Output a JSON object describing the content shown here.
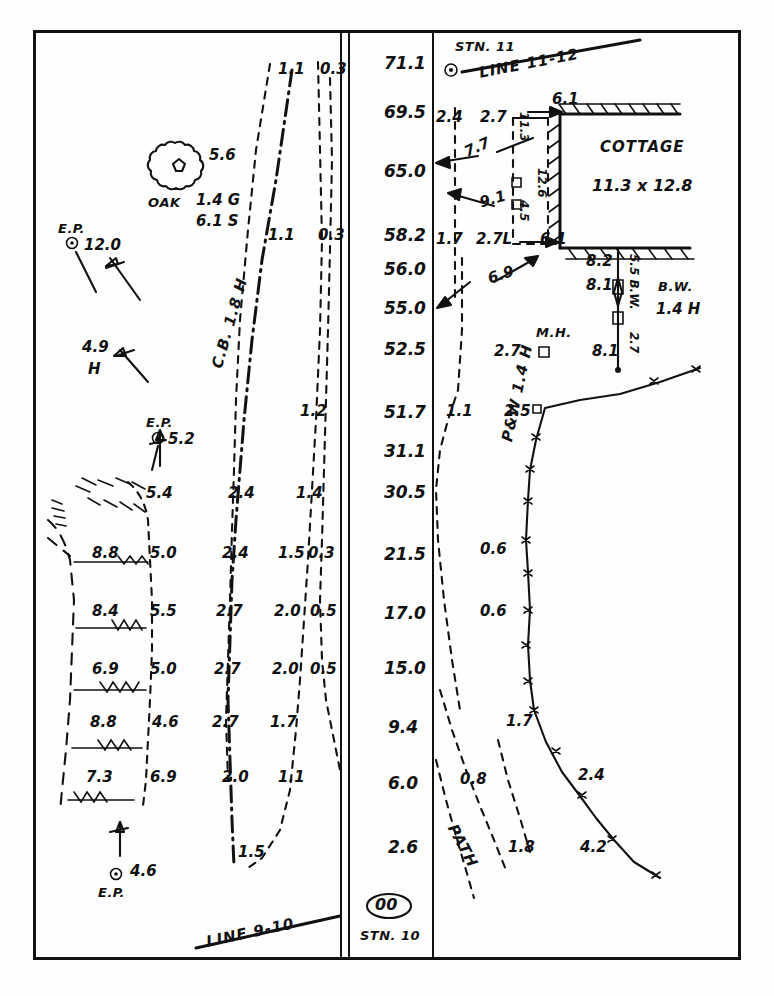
{
  "sheet": {
    "title": "Survey field sketch — offsets between Line 9-10 and Line 11-12",
    "caption": ""
  },
  "stations": {
    "top": {
      "name": "STN. 11",
      "line_label": "LINE 11-12"
    },
    "bottom": {
      "name": "STN. 10",
      "chainage": "00",
      "line_label": "LINE 9-10"
    }
  },
  "chainages": [
    "71.1",
    "69.5",
    "65.0",
    "58.2",
    "56.0",
    "55.0",
    "52.5",
    "51.7",
    "31.1",
    "30.5",
    "21.5",
    "17.0",
    "15.0",
    "9.4",
    "6.0",
    "2.6"
  ],
  "features": {
    "oak": {
      "label": "OAK",
      "offset": "5.6",
      "girth": "1.4 G",
      "spread": "6.1 S"
    },
    "ep_top": {
      "label": "E.P.",
      "value": "12.0"
    },
    "ep_mid": {
      "label": "E.P.",
      "value": "5.2"
    },
    "ep_bottom": {
      "label": "E.P.",
      "value": "4.6"
    },
    "cb": {
      "label": "C.B. 1.8 H"
    },
    "bank_height": {
      "value": "4.9",
      "unit": "H"
    },
    "cottage": {
      "label": "COTTAGE",
      "dims": "11.3 x 12.8"
    },
    "manhole": {
      "label": "M.H.",
      "offset": "2.7"
    },
    "bw": {
      "label": "B.W.",
      "height": "1.4 H"
    },
    "pw_fence": {
      "label": "P&W 1.4 H"
    },
    "path": {
      "label": "PATH"
    }
  },
  "offsets": {
    "col_left": [
      "8.8",
      "8.4",
      "6.9",
      "8.8",
      "7.3"
    ],
    "col_2": [
      "5.4",
      "5.0",
      "5.5",
      "5.0",
      "4.6",
      "6.9"
    ],
    "col_3": [
      "2.4",
      "2.4",
      "2.7",
      "2.7",
      "2.7",
      "2.0",
      "1.5"
    ],
    "col_4": [
      "1.1",
      "1.1",
      "1.2",
      "1.4",
      "1.5",
      "2.0",
      "2.0",
      "1.7",
      "1.1"
    ],
    "col_5": [
      "0.3",
      "0.3",
      "0.3",
      "0.5",
      "0.5"
    ]
  },
  "cottage_ties": {
    "left_a": "2.4",
    "left_b": "2.7",
    "top_tie": "6.1",
    "side_a": "7.7",
    "side_b": "9.1",
    "base_a": "1.7",
    "base_b": "2.7L",
    "base_tie": "6.1",
    "diag": "6.9",
    "vert_a": "11.3",
    "vert_b": "12.6",
    "vert_c": "4.5"
  },
  "wall_ties": {
    "a": "8.2",
    "b": "8.1",
    "c": "8.1",
    "side": "5.5 B.W.",
    "lower": "2.7"
  },
  "fence_offsets": {
    "a": "1.1",
    "b": "2.5",
    "c": "0.6",
    "d": "0.6",
    "e": "1.7",
    "f": "2.4",
    "g": "4.2"
  },
  "path_offsets": {
    "a": "0.8",
    "b": "1.8"
  }
}
